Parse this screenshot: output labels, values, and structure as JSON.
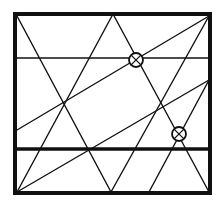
{
  "diagram": {
    "title": "",
    "stroke_color": "#111111",
    "background": "#ffffff",
    "frame": {
      "x1": 15,
      "y1": 14,
      "x2": 210,
      "y2": 193,
      "stroke_width": 4
    },
    "horizontal_lines": [
      {
        "name": "upper-horizontal-line",
        "y": 58,
        "x1": 15,
        "x2": 210,
        "stroke_width": 1.4
      },
      {
        "name": "lower-horizontal-line",
        "y": 149,
        "x1": 15,
        "x2": 210,
        "stroke_width": 3.5
      }
    ],
    "diagonal_lines": [
      {
        "name": "diagonal-topleft-to-bottom-mid",
        "x1": 17,
        "y1": 16,
        "x2": 111,
        "y2": 192
      },
      {
        "name": "diagonal-bottomleft-to-apex",
        "x1": 17,
        "y1": 192,
        "x2": 113,
        "y2": 14
      },
      {
        "name": "diagonal-apex-to-bottomright",
        "x1": 113,
        "y1": 14,
        "x2": 209,
        "y2": 192
      },
      {
        "name": "diagonal-left-to-topright",
        "x1": 17,
        "y1": 130,
        "x2": 209,
        "y2": 16
      },
      {
        "name": "diagonal-bottomleft-to-right",
        "x1": 17,
        "y1": 192,
        "x2": 209,
        "y2": 80
      },
      {
        "name": "diagonal-bottom-mid-to-topright",
        "x1": 111,
        "y1": 192,
        "x2": 209,
        "y2": 16
      },
      {
        "name": "diagonal-bottom-right-to-right",
        "x1": 149,
        "y1": 192,
        "x2": 209,
        "y2": 80
      }
    ],
    "markers": [
      {
        "name": "circled-cross-marker-upper",
        "cx": 136,
        "cy": 60,
        "r": 7
      },
      {
        "name": "circled-cross-marker-lower",
        "cx": 179,
        "cy": 134,
        "r": 7
      }
    ]
  }
}
